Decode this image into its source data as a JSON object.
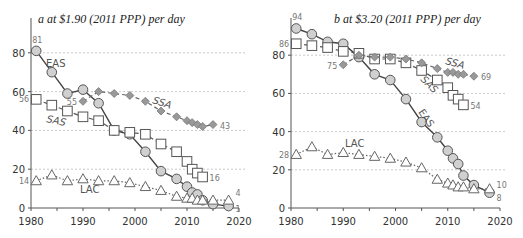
{
  "chart_data": [
    {
      "type": "line",
      "title": "a at $1.90 (2011 PPP) per day",
      "xlabel": "",
      "ylabel": "",
      "xlim": [
        1980,
        2020
      ],
      "ylim": [
        0,
        90
      ],
      "x_ticks": [
        "1980",
        "1990",
        "2000",
        "2010",
        "2020"
      ],
      "y_ticks": [
        "0",
        "20",
        "40",
        "60",
        "80"
      ],
      "grid": true,
      "legend": "inline labels",
      "series": [
        {
          "name": "EAS",
          "marker": "circle",
          "line": "solid",
          "x": [
            1981,
            1984,
            1987,
            1990,
            1993,
            1996,
            1999,
            2002,
            2005,
            2008,
            2010,
            2011,
            2012,
            2013,
            2015,
            2018
          ],
          "values": [
            81,
            70,
            59,
            61,
            54,
            40,
            38,
            29,
            19,
            15,
            11,
            8,
            7,
            4,
            2,
            1
          ],
          "start_label": "81",
          "end_label": "1"
        },
        {
          "name": "SAS",
          "marker": "square",
          "line": "dashed",
          "x": [
            1981,
            1984,
            1987,
            1990,
            1993,
            1996,
            1999,
            2002,
            2005,
            2008,
            2010,
            2011,
            2012,
            2013
          ],
          "values": [
            56,
            53,
            50,
            47,
            45,
            40,
            39,
            38,
            33,
            29,
            24,
            20,
            18,
            16
          ],
          "start_label": "56",
          "end_label": "16"
        },
        {
          "name": "SSA",
          "marker": "diamond",
          "line": "dashed",
          "x": [
            1990,
            1993,
            1996,
            1999,
            2002,
            2005,
            2008,
            2010,
            2011,
            2012,
            2013,
            2015
          ],
          "values": [
            55,
            60,
            59,
            58,
            55,
            50,
            47,
            45,
            44,
            43,
            42,
            43
          ],
          "start_label": "55",
          "end_label": "43"
        },
        {
          "name": "LAC",
          "marker": "triangle",
          "line": "dotted",
          "x": [
            1981,
            1984,
            1987,
            1990,
            1993,
            1996,
            1999,
            2002,
            2005,
            2008,
            2010,
            2011,
            2012,
            2013,
            2015,
            2018
          ],
          "values": [
            14,
            17,
            14,
            15,
            14,
            14,
            13,
            11,
            9,
            6,
            5,
            5,
            4,
            4,
            4,
            4
          ],
          "start_label": "14",
          "end_label": "4"
        }
      ]
    },
    {
      "type": "line",
      "title": "b at $3.20 (2011 PPP) per day",
      "xlabel": "",
      "ylabel": "",
      "xlim": [
        1980,
        2020
      ],
      "ylim": [
        0,
        95
      ],
      "x_ticks": [
        "1980",
        "1990",
        "2000",
        "2010",
        "2020"
      ],
      "y_ticks": [
        "0",
        "20",
        "40",
        "60",
        "80"
      ],
      "grid": true,
      "legend": "inline labels",
      "series": [
        {
          "name": "EAS",
          "marker": "circle",
          "line": "solid",
          "x": [
            1981,
            1984,
            1987,
            1990,
            1993,
            1996,
            1999,
            2002,
            2005,
            2008,
            2010,
            2011,
            2012,
            2013,
            2015,
            2018
          ],
          "values": [
            94,
            91,
            87,
            86,
            79,
            70,
            67,
            57,
            45,
            37,
            30,
            26,
            23,
            17,
            12,
            8
          ],
          "start_label": "94",
          "end_label": "8"
        },
        {
          "name": "SAS",
          "marker": "square",
          "line": "dashed",
          "x": [
            1981,
            1984,
            1987,
            1990,
            1993,
            1996,
            1999,
            2002,
            2005,
            2008,
            2010,
            2011,
            2012,
            2013
          ],
          "values": [
            86,
            85,
            84,
            82,
            81,
            78,
            78,
            76,
            72,
            67,
            63,
            59,
            57,
            54
          ],
          "start_label": "86",
          "end_label": "54"
        },
        {
          "name": "SSA",
          "marker": "diamond",
          "line": "dashed",
          "x": [
            1990,
            1993,
            1996,
            1999,
            2002,
            2005,
            2008,
            2010,
            2011,
            2012,
            2013,
            2015
          ],
          "values": [
            75,
            80,
            79,
            79,
            78,
            76,
            73,
            71,
            71,
            70,
            70,
            69
          ],
          "start_label": "75",
          "end_label": "69"
        },
        {
          "name": "LAC",
          "marker": "triangle",
          "line": "dotted",
          "x": [
            1981,
            1984,
            1987,
            1990,
            1993,
            1996,
            1999,
            2002,
            2005,
            2008,
            2010,
            2011,
            2012,
            2013,
            2015,
            2018
          ],
          "values": [
            28,
            32,
            28,
            29,
            28,
            27,
            26,
            24,
            21,
            15,
            13,
            12,
            11,
            11,
            10,
            10
          ],
          "start_label": "28",
          "end_label": "10"
        }
      ]
    }
  ],
  "panels": [
    {
      "title": "a at $1.90 (2011 PPP) per day"
    },
    {
      "title": "b at $3.20 (2011 PPP) per day"
    }
  ]
}
